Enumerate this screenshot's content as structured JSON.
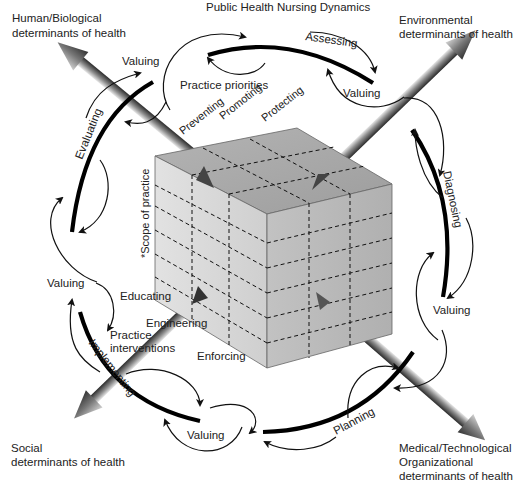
{
  "title": "Public Health Nursing Dynamics",
  "determinants": {
    "top_left": [
      "Human/Biological",
      "determinants of health"
    ],
    "top_right": [
      "Environmental",
      "determinants of health"
    ],
    "bottom_left": [
      "Social",
      "determinants of health"
    ],
    "bottom_right": [
      "Medical/Technological",
      "Organizational",
      "determinants of health"
    ]
  },
  "process": {
    "assessing": "Assessing",
    "diagnosing": "Diagnosing",
    "planning": "Planning",
    "implementing": "Implementing",
    "evaluating": "Evaluating",
    "valuing": "Valuing"
  },
  "cube": {
    "top_axis_label": "Practice priorities",
    "priorities": [
      "Preventing",
      "Promoting",
      "Protecting"
    ],
    "side_axis_label": "*Scope of practice",
    "front_axis_label": [
      "Practice",
      "interventions"
    ],
    "interventions": [
      "Educating",
      "Engineering",
      "Enforcing"
    ],
    "colors": {
      "top": "#a9a9a9",
      "left": "#d8d8d8",
      "front": "#b9b9b9"
    }
  }
}
